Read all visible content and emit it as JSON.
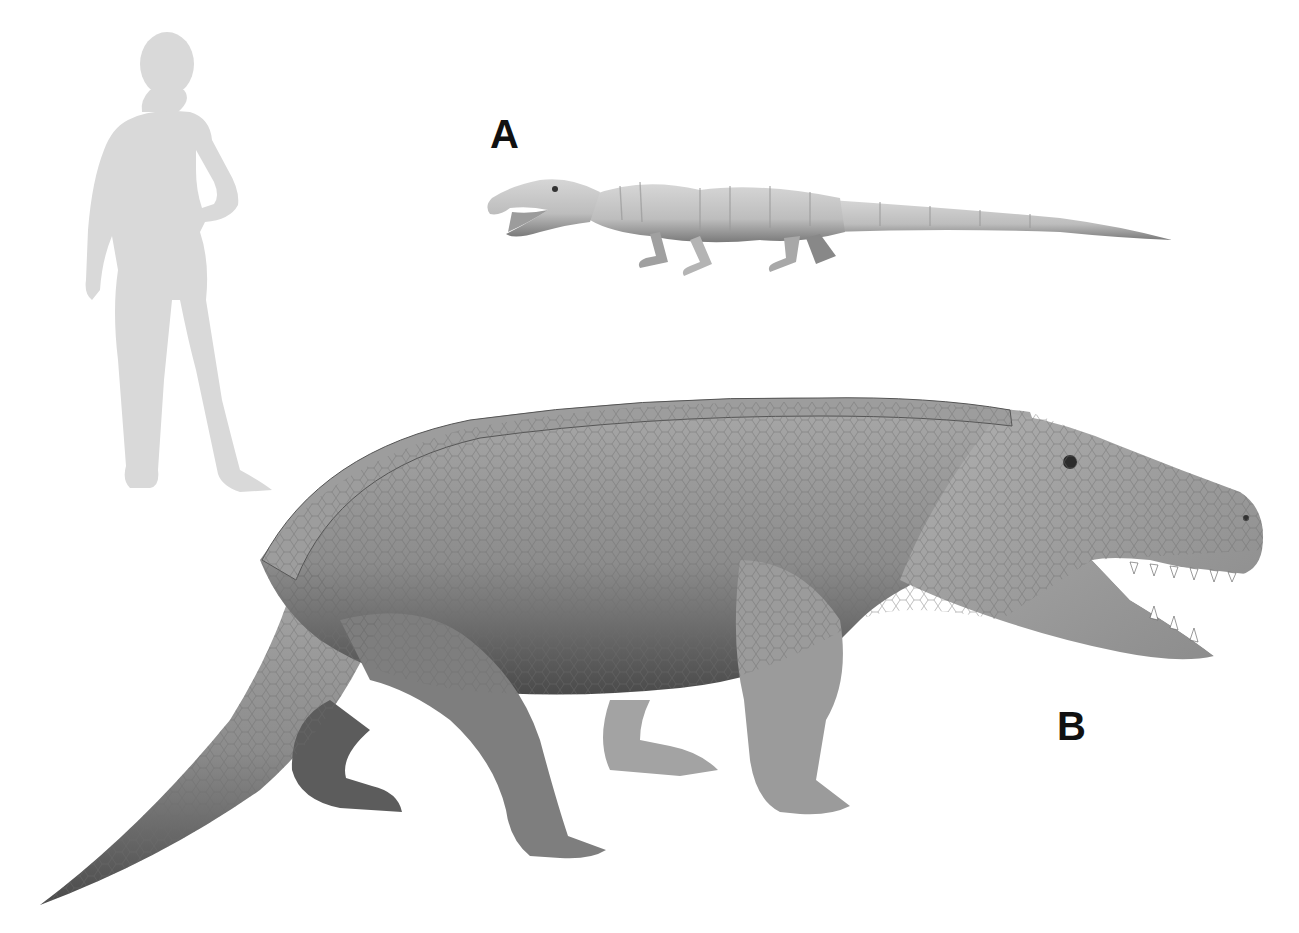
{
  "figure": {
    "type": "size-comparison-illustration",
    "background": "#ffffff",
    "labels": [
      {
        "id": "A",
        "text": "A"
      },
      {
        "id": "B",
        "text": "B"
      }
    ],
    "subjects": [
      {
        "name": "human-silhouette",
        "color": "#d9d9d9",
        "description": "standing woman silhouette for scale, hand on hip"
      },
      {
        "name": "creature-a",
        "label": "A",
        "color": "#c9c9c9",
        "description": "small slender quadrupedal reptile with long tail, open jaws, faint banding"
      },
      {
        "name": "creature-b",
        "label": "B",
        "color": "#8f8f8f",
        "description": "large heavy-bodied quadrupedal reptile with scaly hide, dorsal osteoderm row, open toothed jaws"
      }
    ]
  }
}
